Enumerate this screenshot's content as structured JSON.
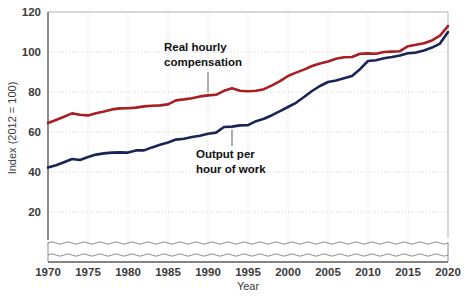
{
  "chart_data": {
    "type": "line",
    "title": "",
    "xlabel": "Year",
    "ylabel": "Index (2012 = 100)",
    "xlim": [
      1970,
      2020
    ],
    "ylim": [
      0,
      120
    ],
    "y_axis_break": true,
    "grid": true,
    "legend_position": "inline-annotations",
    "xticks": [
      "1970",
      "1975",
      "1980",
      "1985",
      "1990",
      "1995",
      "2000",
      "2005",
      "2010",
      "2015",
      "2020"
    ],
    "yticks": [
      "20",
      "40",
      "60",
      "80",
      "100",
      "120"
    ],
    "x": [
      1970,
      1971,
      1972,
      1973,
      1974,
      1975,
      1976,
      1977,
      1978,
      1979,
      1980,
      1981,
      1982,
      1983,
      1984,
      1985,
      1986,
      1987,
      1988,
      1989,
      1990,
      1991,
      1992,
      1993,
      1994,
      1995,
      1996,
      1997,
      1998,
      1999,
      2000,
      2001,
      2002,
      2003,
      2004,
      2005,
      2006,
      2007,
      2008,
      2009,
      2010,
      2011,
      2012,
      2013,
      2014,
      2015,
      2016,
      2017,
      2018,
      2019,
      2020
    ],
    "series": [
      {
        "name": "Real hourly compensation",
        "color": "#a81f23",
        "values": [
          64.5,
          66.0,
          67.6,
          69.3,
          68.6,
          68.3,
          69.4,
          70.3,
          71.3,
          71.8,
          71.9,
          72.2,
          72.8,
          73.1,
          73.3,
          73.8,
          75.8,
          76.3,
          76.9,
          77.8,
          78.3,
          78.6,
          80.6,
          81.9,
          80.6,
          80.4,
          80.6,
          81.4,
          83.3,
          85.4,
          88.0,
          89.7,
          91.2,
          93.0,
          94.3,
          95.2,
          96.6,
          97.4,
          97.5,
          99.1,
          99.3,
          99.1,
          100.0,
          100.2,
          100.4,
          102.9,
          103.6,
          104.4,
          105.8,
          108.2,
          113.0
        ]
      },
      {
        "name": "Output per hour of work",
        "color": "#1b2456",
        "values": [
          42.2,
          43.4,
          44.9,
          46.5,
          46.0,
          47.5,
          48.7,
          49.3,
          49.7,
          49.8,
          49.7,
          50.8,
          50.8,
          52.3,
          53.6,
          54.8,
          56.2,
          56.6,
          57.5,
          58.1,
          59.1,
          59.7,
          62.5,
          62.7,
          63.3,
          63.4,
          65.4,
          66.6,
          68.4,
          70.4,
          72.5,
          74.6,
          77.5,
          80.5,
          83.0,
          85.0,
          85.8,
          86.9,
          88.0,
          91.4,
          95.5,
          95.9,
          96.9,
          97.5,
          98.3,
          99.4,
          99.7,
          100.8,
          102.2,
          104.2,
          110.0
        ]
      }
    ],
    "annotations": [
      {
        "id": "annotation-real-hourly-compensation",
        "line1": "Real hourly",
        "line2": "compensation",
        "points_to_series": "Real hourly compensation",
        "points_to_year": 1990
      },
      {
        "id": "annotation-output-per-hour",
        "line1": "Output per",
        "line2": "hour of work",
        "points_to_series": "Output per hour of work",
        "points_to_year": 1993
      }
    ],
    "colors": {
      "red_series": "#a81f23",
      "navy_series": "#1b2456",
      "gridline": "#c9c9c9",
      "axis": "#5b5b5b",
      "text": "#231f20",
      "background": "#ffffff"
    }
  }
}
